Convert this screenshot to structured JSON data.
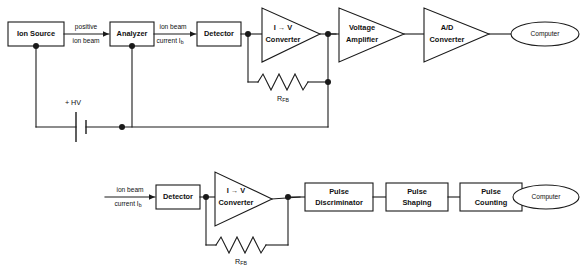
{
  "diagram": {
    "stroke_color": "#1a1a1a",
    "background_color": "#ffffff",
    "rows": [
      {
        "id": "analog-chain",
        "name": "Analog current measurement chain",
        "blocks": [
          {
            "id": "ion-source",
            "shape": "rect",
            "label": "Ion Source"
          },
          {
            "id": "analyzer",
            "shape": "rect",
            "label": "Analyzer"
          },
          {
            "id": "detector-top",
            "shape": "rect",
            "label": "Detector"
          },
          {
            "id": "iv-converter-top",
            "shape": "triangle",
            "label_line1": "I → V",
            "label_line2": "Converter"
          },
          {
            "id": "voltage-amplifier",
            "shape": "triangle",
            "label_line1": "Voltage",
            "label_line2": "Amplifier"
          },
          {
            "id": "ad-converter",
            "shape": "triangle",
            "label_line1": "A/D",
            "label_line2": "Converter"
          },
          {
            "id": "computer-top",
            "shape": "ellipse",
            "label": "Computer"
          }
        ],
        "signal_labels": [
          {
            "id": "positive-ion-beam",
            "line1": "positive",
            "line2": "ion beam"
          },
          {
            "id": "ion-beam-current-top",
            "line1": "ion beam",
            "line2_prefix": "current I",
            "line2_sub": "b"
          }
        ],
        "feedback": {
          "id": "rfb-top",
          "symbol": "resistor",
          "label_prefix": "R",
          "label_sub": "FB"
        },
        "supply": {
          "id": "high-voltage-supply",
          "symbol": "battery",
          "label": "+ HV"
        }
      },
      {
        "id": "pulse-counting-chain",
        "name": "Pulse counting chain",
        "blocks": [
          {
            "id": "detector-bottom",
            "shape": "rect",
            "label": "Detector"
          },
          {
            "id": "iv-converter-bottom",
            "shape": "triangle",
            "label_line1": "I → V",
            "label_line2": "Converter"
          },
          {
            "id": "pulse-discriminator",
            "shape": "rect",
            "label_line1": "Pulse",
            "label_line2": "Discriminator"
          },
          {
            "id": "pulse-shaping",
            "shape": "rect",
            "label_line1": "Pulse",
            "label_line2": "Shaping"
          },
          {
            "id": "pulse-counting",
            "shape": "rect",
            "label_line1": "Pulse",
            "label_line2": "Counting"
          },
          {
            "id": "computer-bottom",
            "shape": "ellipse",
            "label": "Computer"
          }
        ],
        "signal_labels": [
          {
            "id": "ion-beam-current-bottom",
            "line1": "ion beam",
            "line2_prefix": "current I",
            "line2_sub": "b"
          }
        ],
        "feedback": {
          "id": "rfb-bottom",
          "symbol": "resistor",
          "label_prefix": "R",
          "label_sub": "FB"
        }
      }
    ]
  }
}
